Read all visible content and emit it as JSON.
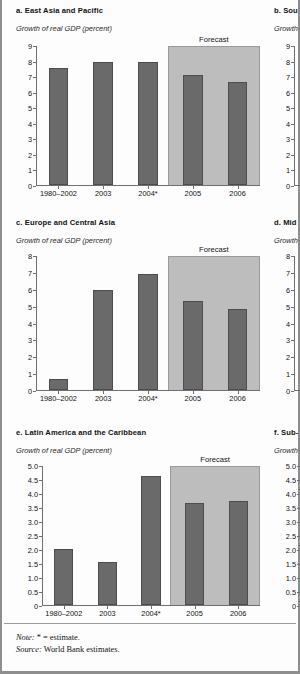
{
  "document": {
    "note_label": "Note:",
    "note_text": "* = estimate.",
    "source_label": "Source:",
    "source_text": "World Bank estimates.",
    "axis_title": "Growth of real GDP (percent)",
    "forecast_label": "Forecast"
  },
  "panels": [
    {
      "id": "a",
      "title": "a. East Asia and Pacific"
    },
    {
      "id": "b",
      "title": "b. Sou"
    },
    {
      "id": "c",
      "title": "c. Europe and Central Asia"
    },
    {
      "id": "d",
      "title": "d. Mid"
    },
    {
      "id": "e",
      "title": "e. Latin America and the Caribbean"
    },
    {
      "id": "f",
      "title": "f. Sub-"
    }
  ],
  "chart_data": [
    {
      "type": "bar",
      "id": "a",
      "title": "a. East Asia and Pacific",
      "ylabel": "Growth of real GDP (percent)",
      "xlabel": "",
      "categories": [
        "1980–2002",
        "2003",
        "2004*",
        "2005",
        "2006"
      ],
      "values": [
        7.5,
        7.9,
        7.9,
        7.1,
        6.6
      ],
      "ylim": [
        0,
        9
      ],
      "yticks": [
        "0",
        "1",
        "2",
        "3",
        "4",
        "5",
        "6",
        "7",
        "8",
        "9"
      ],
      "grid": false,
      "legend": "none",
      "annotations": [
        {
          "text": "Forecast",
          "covers": [
            "2005",
            "2006"
          ]
        }
      ]
    },
    {
      "type": "bar",
      "id": "b",
      "title": "b. Sou",
      "ylabel": "Growth of real GDP (percent)",
      "xlabel": "",
      "categories": [
        "19"
      ],
      "values": [],
      "ylim": [
        0,
        9
      ],
      "yticks": [
        "0",
        "1",
        "2",
        "3",
        "4",
        "5",
        "6",
        "7",
        "8",
        "9"
      ],
      "grid": false,
      "legend": "none",
      "annotations": [],
      "clipped": true
    },
    {
      "type": "bar",
      "id": "c",
      "title": "c. Europe and Central Asia",
      "ylabel": "Growth of real GDP (percent)",
      "xlabel": "",
      "categories": [
        "1980–2002",
        "2003",
        "2004*",
        "2005",
        "2006"
      ],
      "values": [
        0.65,
        5.9,
        6.9,
        5.3,
        4.8
      ],
      "ylim": [
        0,
        8
      ],
      "yticks": [
        "0",
        "1",
        "2",
        "3",
        "4",
        "5",
        "6",
        "7",
        "8"
      ],
      "grid": false,
      "legend": "none",
      "annotations": [
        {
          "text": "Forecast",
          "covers": [
            "2005",
            "2006"
          ]
        }
      ]
    },
    {
      "type": "bar",
      "id": "d",
      "title": "d. Mid",
      "ylabel": "Growth of real GDP (percent)",
      "xlabel": "",
      "categories": [
        "19"
      ],
      "values": [],
      "ylim": [
        0,
        8
      ],
      "yticks": [
        "0",
        "1",
        "2",
        "3",
        "4",
        "5",
        "6",
        "7",
        "8"
      ],
      "grid": false,
      "legend": "none",
      "annotations": [],
      "clipped": true
    },
    {
      "type": "bar",
      "id": "e",
      "title": "e. Latin America and the Caribbean",
      "ylabel": "Growth of real GDP (percent)",
      "xlabel": "",
      "categories": [
        "1980–2002",
        "2003",
        "2004*",
        "2005",
        "2006"
      ],
      "values": [
        2.0,
        1.55,
        4.6,
        3.65,
        3.7
      ],
      "ylim": [
        0,
        5.0
      ],
      "yticks": [
        "0",
        "0.5",
        "1.0",
        "1.5",
        "2.0",
        "2.5",
        "3.0",
        "3.5",
        "4.0",
        "4.5",
        "5.0"
      ],
      "grid": false,
      "legend": "none",
      "annotations": [
        {
          "text": "Forecast",
          "covers": [
            "2005",
            "2006"
          ]
        }
      ]
    },
    {
      "type": "bar",
      "id": "f",
      "title": "f. Sub-",
      "ylabel": "Growth of real GDP (percent)",
      "xlabel": "",
      "categories": [
        "19"
      ],
      "values": [],
      "ylim": [
        0,
        5.0
      ],
      "yticks": [
        "0",
        "0.5",
        "1.0",
        "1.5",
        "2.0",
        "2.5",
        "3.0",
        "3.5",
        "4.0",
        "4.5",
        "5.0"
      ],
      "grid": false,
      "legend": "none",
      "annotations": [],
      "clipped": true
    }
  ],
  "colors": {
    "bar": "#6a6a6a",
    "bar_edge": "#4d4d4d",
    "forecast_band": "#bdbdbd",
    "axis": "#6f6f6f",
    "text": "#111111",
    "page_border": "#8e8e8e"
  }
}
